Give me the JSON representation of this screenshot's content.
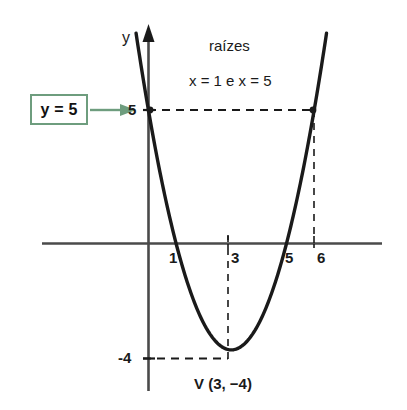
{
  "figure": {
    "background_color": "#ffffff",
    "curve_color": "#1a1a1a",
    "axis_color": "#4a4a4a",
    "accent_color": "#6e9d7e",
    "callout": {
      "label": "y = 5",
      "arrow_icon": "right-arrow-icon"
    },
    "annotations": {
      "roots_title": "raízes",
      "roots_values": "x = 1 e x = 5",
      "vertex_label": "V (3, −4)"
    },
    "axis_labels": {
      "y_axis_name": "y"
    }
  },
  "chart_data": {
    "type": "line",
    "title": "",
    "subtitle": "",
    "xlabel": "",
    "ylabel": "y",
    "grid": false,
    "legend": "none",
    "xlim": [
      -1.45,
      8.1
    ],
    "ylim": [
      -5.9,
      7.6
    ],
    "function": "y = x^2 - 6x + 5",
    "series": [
      {
        "name": "parabola",
        "type": "line",
        "color": "#1a1a1a",
        "x": [
          -0.45,
          -0.2,
          0.2,
          0.6,
          1.0,
          1.5,
          2.0,
          2.5,
          3.0,
          3.5,
          4.0,
          4.5,
          5.0,
          5.4,
          5.8,
          6.0,
          6.3,
          6.45
        ],
        "y": [
          7.9,
          6.24,
          3.84,
          1.76,
          0.0,
          -1.75,
          -3.0,
          -3.75,
          -4.0,
          -3.75,
          -3.0,
          -1.75,
          0.0,
          1.96,
          4.64,
          5.0,
          6.69,
          7.6
        ]
      }
    ],
    "x_ticks": [
      {
        "value": 1,
        "label": "1"
      },
      {
        "value": 3,
        "label": "3"
      },
      {
        "value": 5,
        "label": "5"
      },
      {
        "value": 6,
        "label": "6"
      }
    ],
    "y_ticks": [
      {
        "value": 5,
        "label": "5"
      },
      {
        "value": -4,
        "label": "-4"
      }
    ],
    "points": [
      {
        "name": "y5-left-intersection",
        "x": 0,
        "y": 5
      },
      {
        "name": "y5-right-intersection",
        "x": 6,
        "y": 5
      },
      {
        "name": "root-left",
        "x": 1,
        "y": 0
      },
      {
        "name": "root-right",
        "x": 5,
        "y": 0
      },
      {
        "name": "vertex",
        "x": 3,
        "y": -4
      }
    ],
    "guide_lines": [
      {
        "name": "y-equals-5-horizontal",
        "orientation": "horizontal",
        "value": 5,
        "from": 0,
        "to": 6,
        "style": "dashed"
      },
      {
        "name": "x-equals-6-vertical",
        "orientation": "vertical",
        "value": 6,
        "from": 0,
        "to": 5,
        "style": "dashed"
      },
      {
        "name": "x-equals-3-vertical",
        "orientation": "vertical",
        "value": 3,
        "from": 0,
        "to": -4,
        "style": "dashed"
      },
      {
        "name": "y-equals-minus4-horizontal",
        "orientation": "horizontal",
        "value": -4,
        "from": 0,
        "to": 3,
        "style": "dashed"
      }
    ]
  }
}
